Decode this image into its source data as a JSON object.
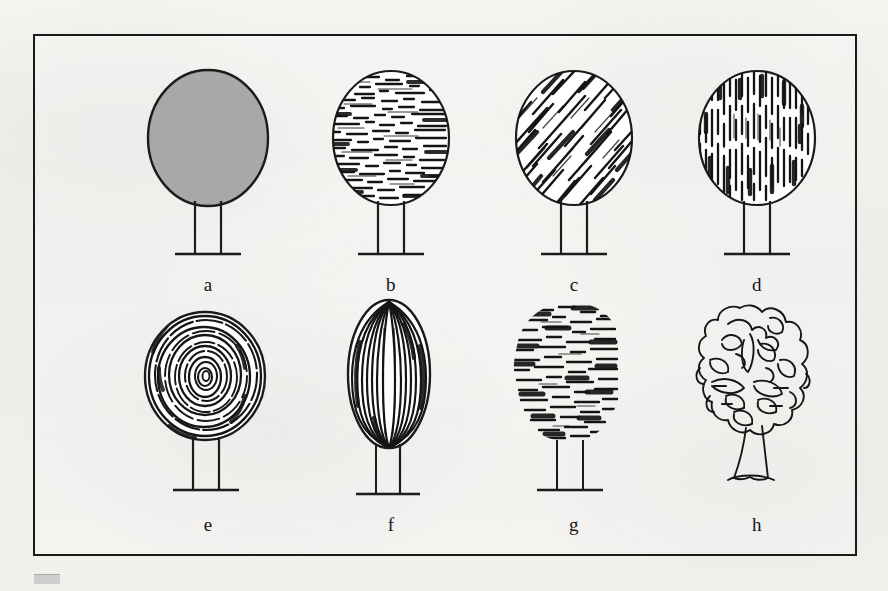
{
  "figure": {
    "background_color": "#f2f1ee",
    "frame_color": "#1a1a1a",
    "ink_color": "#111111",
    "fill_gray": "#a8a8a8",
    "rows": 2,
    "columns": 4,
    "label_font_style": "serif lowercase italicless"
  },
  "trees": [
    {
      "id": "tree-a",
      "label": "a",
      "crown_shape": "oval",
      "style": "solid-gray-fill",
      "style_description": "Solid flat gray tone, plain outline, no texture",
      "trunk": "two straight parallel lines",
      "ground_line": true,
      "fill": "#a8a8a8",
      "row": 1,
      "column": 1
    },
    {
      "id": "tree-b",
      "label": "b",
      "crown_shape": "oval",
      "style": "horizontal-hatching",
      "style_description": "Dense short horizontal strokes, lighter at centre",
      "trunk": "two straight parallel lines",
      "ground_line": true,
      "row": 1,
      "column": 2
    },
    {
      "id": "tree-c",
      "label": "c",
      "crown_shape": "oval",
      "style": "diagonal-hatching",
      "style_description": "Diagonal strokes running upper-right to lower-left",
      "trunk": "two straight parallel lines",
      "ground_line": true,
      "row": 1,
      "column": 3
    },
    {
      "id": "tree-d",
      "label": "d",
      "crown_shape": "oval",
      "style": "vertical-hatching",
      "style_description": "Dense vertical strokes, open highlight near centre",
      "trunk": "two straight parallel lines",
      "ground_line": true,
      "row": 1,
      "column": 4
    },
    {
      "id": "tree-e",
      "label": "e",
      "crown_shape": "round",
      "style": "concentric-rings",
      "style_description": "Concentric spiralling contour rings from centre outward",
      "trunk": "two straight parallel lines",
      "ground_line": true,
      "row": 2,
      "column": 1
    },
    {
      "id": "tree-f",
      "label": "f",
      "crown_shape": "tall-egg",
      "style": "vertical-contour-lines",
      "style_description": "Long curved vertical contour lines following the egg form",
      "trunk": "two straight parallel lines",
      "ground_line": true,
      "row": 2,
      "column": 2
    },
    {
      "id": "tree-g",
      "label": "g",
      "crown_shape": "loose-cloud",
      "style": "broken-horizontal-strokes",
      "style_description": "Loose broken horizontal dashes with soft ragged edge, no outline",
      "trunk": "two straight parallel lines",
      "ground_line": true,
      "row": 2,
      "column": 3
    },
    {
      "id": "tree-h",
      "label": "h",
      "crown_shape": "scalloped-outline",
      "style": "freehand-scribble-outline",
      "style_description": "Pure freehand wandering contour line, no shading",
      "trunk": "tapered freehand trunk with flared base",
      "ground_line": false,
      "row": 2,
      "column": 4
    }
  ]
}
